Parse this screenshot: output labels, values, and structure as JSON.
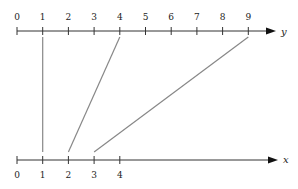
{
  "diagram": {
    "type": "function-mapping",
    "top_axis": {
      "label": "y",
      "ticks": [
        "0",
        "1",
        "2",
        "3",
        "4",
        "5",
        "6",
        "7",
        "8",
        "9"
      ]
    },
    "bottom_axis": {
      "label": "x",
      "ticks": [
        "0",
        "1",
        "2",
        "3",
        "4"
      ]
    },
    "mappings": [
      {
        "from": 1,
        "to": 1
      },
      {
        "from": 2,
        "to": 4
      },
      {
        "from": 3,
        "to": 9
      }
    ],
    "colors": {
      "axis": "#333333",
      "mapping_line": "#888888"
    }
  }
}
